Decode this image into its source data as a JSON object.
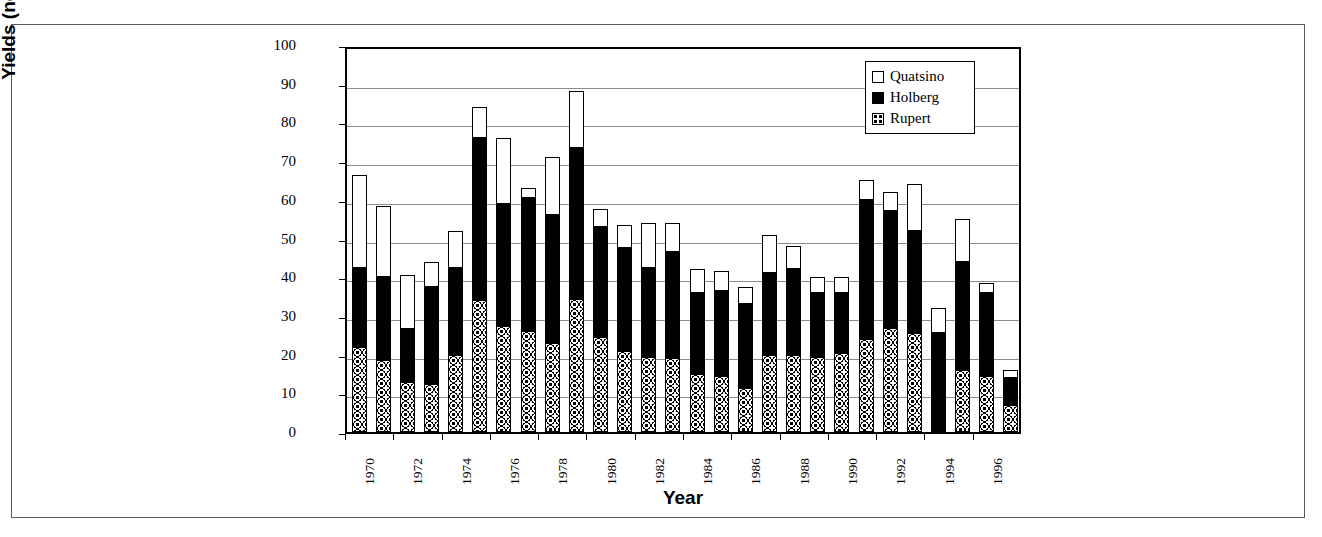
{
  "chart_data": {
    "type": "bar",
    "stacked": true,
    "title": "",
    "xlabel": "Year",
    "ylabel": "Yields (nos./trap 18 h set)",
    "ylim": [
      0,
      100
    ],
    "ytick_labels": [
      "0",
      "10",
      "20",
      "30",
      "40",
      "50",
      "60",
      "70",
      "80",
      "90",
      "100"
    ],
    "ytick_values": [
      0,
      10,
      20,
      30,
      40,
      50,
      60,
      70,
      80,
      90,
      100
    ],
    "grid": "horizontal",
    "legend_position": "top-right",
    "legend_entries": [
      "Quatsino",
      "Holberg",
      "Rupert"
    ],
    "categories": [
      "1970",
      "1971",
      "1972",
      "1973",
      "1974",
      "1975",
      "1976",
      "1977",
      "1978",
      "1979",
      "1980",
      "1981",
      "1982",
      "1983",
      "1984",
      "1985",
      "1986",
      "1987",
      "1988",
      "1989",
      "1990",
      "1991",
      "1992",
      "1993",
      "1994",
      "1995",
      "1996",
      "1997"
    ],
    "xtick_labels_shown": [
      "1970",
      "1972",
      "1974",
      "1976",
      "1978",
      "1980",
      "1982",
      "1984",
      "1986",
      "1988",
      "1990",
      "1992",
      "1994",
      "1996"
    ],
    "series": [
      {
        "name": "Rupert",
        "pattern": "dotted",
        "values": [
          22,
          18.5,
          13,
          12.5,
          20,
          34,
          27.5,
          26,
          23,
          34.5,
          24.5,
          21,
          19.5,
          19,
          15,
          14.5,
          11.5,
          20,
          20,
          19.5,
          20.5,
          24,
          27,
          25.5,
          0,
          16,
          14.5,
          7
        ]
      },
      {
        "name": "Holberg",
        "pattern": "solid-black",
        "values": [
          20.5,
          21.5,
          13.5,
          25,
          22.5,
          42,
          31.5,
          34.5,
          33,
          39,
          28.5,
          26.5,
          23,
          27.5,
          21,
          22,
          21.5,
          21,
          22,
          16.5,
          15.5,
          36,
          30,
          26.5,
          25.5,
          28,
          21.5,
          7
        ]
      },
      {
        "name": "Quatsino",
        "pattern": "open-white",
        "values": [
          24,
          18.5,
          14,
          6.5,
          9.5,
          8,
          17,
          2.5,
          15,
          14.5,
          4.5,
          6,
          11.5,
          7.5,
          6,
          5,
          4.5,
          10,
          6,
          4,
          4,
          5,
          5,
          12,
          6.5,
          11,
          2.5,
          2
        ]
      }
    ],
    "totals": [
      66.5,
      58.5,
      40.5,
      44,
      52,
      84,
      76,
      63,
      71,
      88,
      57.5,
      53.5,
      54,
      54,
      42,
      41.5,
      37.5,
      51,
      48,
      40,
      40,
      65,
      62,
      64,
      32,
      55,
      38.5,
      16
    ]
  },
  "colors": {
    "series_quatsino": "#ffffff",
    "series_holberg": "#000000",
    "series_rupert": "#ffffff",
    "outline": "#000000",
    "gridline": "#8d8d8d",
    "background": "#ffffff"
  }
}
